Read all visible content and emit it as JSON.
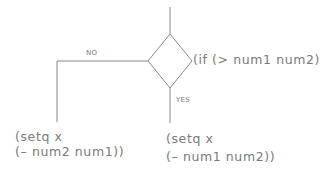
{
  "diagram": {
    "type": "flowchart-decision",
    "stroke_color": "#8a8a8a",
    "text_color": "#7a7a7a",
    "decision": {
      "shape": "diamond",
      "condition": "(if (> num1 num2)"
    },
    "branches": {
      "no": {
        "label": "NO",
        "action_line1": "(setq x",
        "action_line2": "(– num2 num1))"
      },
      "yes": {
        "label": "YES",
        "action_line1": "(setq x",
        "action_line2": "(– num1 num2))"
      }
    }
  }
}
